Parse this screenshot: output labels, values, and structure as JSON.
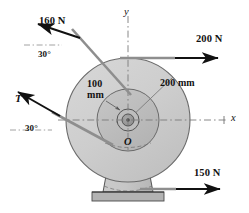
{
  "figure": {
    "type": "engineering-mechanics-free-body-diagram",
    "background_color": "#ffffff",
    "ink_color": "#111111"
  },
  "axes": {
    "x_label": "x",
    "y_label": "y",
    "origin_label": "O",
    "style": "dash-dot centerline"
  },
  "geometry": {
    "center": {
      "x": 128,
      "y": 120
    },
    "outer_radius_px": 62,
    "inner_radius_px": 31,
    "hub_outer_radius_px": 11,
    "hub_inner_radius_px": 6,
    "disc_fill": "#cfcfcf",
    "inner_fill": "#b9b9b9",
    "hub_fill": "#9a9a9a",
    "pedestal_fill": "#c4c4c4",
    "ground_fill": "#b0b0b0"
  },
  "dimensions": [
    {
      "id": "outer-radius",
      "label": "200 mm",
      "value": 200,
      "unit": "mm",
      "describes": "outer drum radius"
    },
    {
      "id": "inner-radius",
      "label_line1": "100",
      "label_line2": "mm",
      "label": "100 mm",
      "value": 100,
      "unit": "mm",
      "describes": "inner drum radius"
    }
  ],
  "forces": [
    {
      "id": "force-160n",
      "label": "160 N",
      "magnitude": 160,
      "unit": "N",
      "direction": "up-left",
      "angle_label": "30°",
      "angle_value": 30,
      "applied_at": "tangent to inner drum, upper side"
    },
    {
      "id": "force-200n",
      "label": "200 N",
      "magnitude": 200,
      "unit": "N",
      "direction": "right",
      "angle_label": null,
      "applied_at": "tangent to top of outer drum"
    },
    {
      "id": "force-T",
      "label": "T",
      "magnitude": null,
      "unit": "N",
      "direction": "up-left",
      "angle_label": "30°",
      "angle_value": 30,
      "applied_at": "tangent to inner drum, lower side"
    },
    {
      "id": "force-150n",
      "label": "150 N",
      "magnitude": 150,
      "unit": "N",
      "direction": "right",
      "angle_label": null,
      "applied_at": "tangent to bottom of outer drum"
    }
  ],
  "angles": [
    {
      "id": "angle-upper",
      "label": "30°",
      "value": 30
    },
    {
      "id": "angle-lower",
      "label": "30°",
      "value": 30
    }
  ]
}
